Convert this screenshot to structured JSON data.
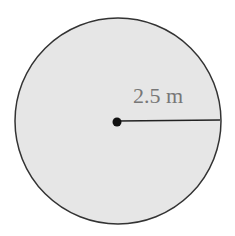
{
  "diagram": {
    "shape": "circle",
    "radius_label": "2.5 m",
    "colors": {
      "fill": "#e6e6e6",
      "stroke": "#333333",
      "label": "#777777",
      "center_dot": "#111111"
    }
  }
}
